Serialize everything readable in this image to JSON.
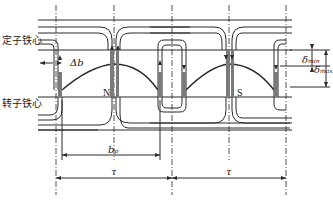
{
  "diagram": {
    "type": "motor air-gap cross-section",
    "labels": {
      "stator_core": "定子铁心",
      "rotor_core": "转子铁心",
      "delta_b": "Δb",
      "pole_n": "N",
      "pole_s": "S",
      "delta_min": "δ",
      "delta_min_sub": "min",
      "delta_max": "δ",
      "delta_max_sub": "max",
      "b_p": "b",
      "b_p_sub": "p",
      "tau_1": "τ",
      "tau_2": "τ"
    },
    "colors": {
      "line": "#2a2a2a",
      "pole_fill": "#7a7a7a",
      "background": "#ffffff"
    }
  }
}
